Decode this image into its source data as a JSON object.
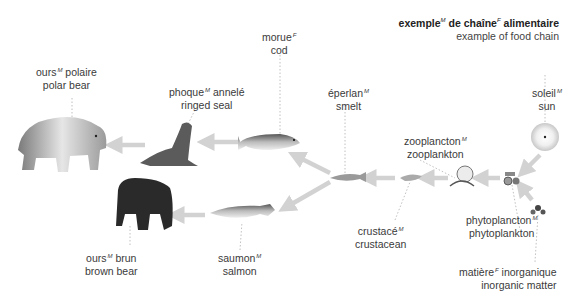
{
  "title": {
    "fr": "exemple",
    "fr_g1": "M",
    "fr_mid": " de chaîne",
    "fr_g2": "F",
    "fr_end": " alimentaire",
    "en": "example of food chain"
  },
  "organisms": [
    {
      "id": "polar-bear",
      "fr": "ours",
      "gender": "M",
      "fr_suffix": " polaire",
      "en": "polar bear"
    },
    {
      "id": "ringed-seal",
      "fr": "phoque",
      "gender": "M",
      "fr_suffix": " annelé",
      "en": "ringed seal"
    },
    {
      "id": "cod",
      "fr": "morue",
      "gender": "F",
      "fr_suffix": "",
      "en": "cod"
    },
    {
      "id": "smelt",
      "fr": "éperlan",
      "gender": "M",
      "fr_suffix": "",
      "en": "smelt"
    },
    {
      "id": "zooplankton",
      "fr": "zooplancton",
      "gender": "M",
      "fr_suffix": "",
      "en": "zooplankton"
    },
    {
      "id": "sun",
      "fr": "soleil",
      "gender": "M",
      "fr_suffix": "",
      "en": "sun"
    },
    {
      "id": "phytoplankton",
      "fr": "phytoplancton",
      "gender": "M",
      "fr_suffix": "",
      "en": "phytoplankton"
    },
    {
      "id": "inorganic-matter",
      "fr": "matière",
      "gender": "F",
      "fr_suffix": " inorganique",
      "en": "inorganic matter"
    },
    {
      "id": "crustacean",
      "fr": "crustacé",
      "gender": "M",
      "fr_suffix": "",
      "en": "crustacean"
    },
    {
      "id": "salmon",
      "fr": "saumon",
      "gender": "M",
      "fr_suffix": "",
      "en": "salmon"
    },
    {
      "id": "brown-bear",
      "fr": "ours",
      "gender": "M",
      "fr_suffix": " brun",
      "en": "brown bear"
    }
  ],
  "flows": [
    {
      "from": "sun",
      "to": "phytoplankton"
    },
    {
      "from": "inorganic-matter",
      "to": "phytoplankton"
    },
    {
      "from": "phytoplankton",
      "to": "zooplankton"
    },
    {
      "from": "zooplankton",
      "to": "crustacean"
    },
    {
      "from": "crustacean",
      "to": "smelt"
    },
    {
      "from": "smelt",
      "to": "cod"
    },
    {
      "from": "smelt",
      "to": "salmon"
    },
    {
      "from": "cod",
      "to": "ringed-seal"
    },
    {
      "from": "ringed-seal",
      "to": "polar-bear"
    },
    {
      "from": "salmon",
      "to": "brown-bear"
    }
  ],
  "colors": {
    "arrow": "#d2d2d2",
    "text": "#3a3a3a",
    "leader": "#b0b0b0"
  }
}
